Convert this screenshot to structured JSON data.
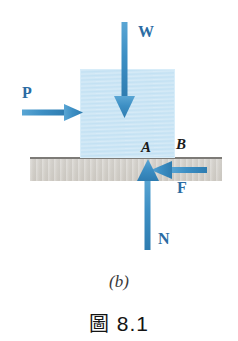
{
  "figure": {
    "sub_caption": "(b)",
    "caption_word": "圖",
    "caption_number": "8.1",
    "colors": {
      "arrow_blue": "#3d8fc4",
      "label_blue": "#2b6ca3",
      "block_fill": "#c3e1f3",
      "ground_fill": "#d2cfc9",
      "ground_line": "#7d7b77",
      "point_label": "#1a1a1a"
    }
  },
  "diagram": {
    "body": {
      "name": "block",
      "shape": "rectangle"
    },
    "surface": {
      "name": "ground",
      "shape": "horizontal-band"
    },
    "points": [
      {
        "id": "A",
        "label": "A",
        "description": "contact point at block corner"
      },
      {
        "id": "B",
        "label": "B",
        "description": "point on surface right of block"
      }
    ],
    "forces": [
      {
        "id": "W",
        "label": "W",
        "meaning": "weight",
        "direction": "down",
        "x": 125,
        "from_y": 22,
        "to_y": 117
      },
      {
        "id": "P",
        "label": "P",
        "meaning": "applied force",
        "direction": "right",
        "y": 113,
        "from_x": 22,
        "to_x": 82
      },
      {
        "id": "F",
        "label": "F",
        "meaning": "friction force",
        "direction": "left",
        "y": 170,
        "from_x": 207,
        "to_x": 150
      },
      {
        "id": "N",
        "label": "N",
        "meaning": "normal force",
        "direction": "up",
        "x": 148,
        "from_y": 250,
        "to_y": 160
      }
    ]
  }
}
